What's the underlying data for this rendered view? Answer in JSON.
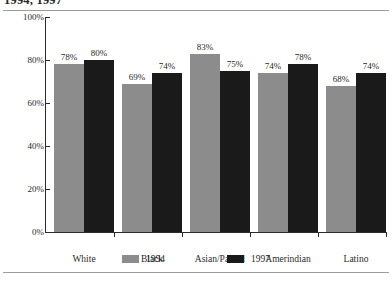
{
  "figure": {
    "title": "1994, 1997"
  },
  "legend": {
    "position": "bottom-center",
    "items": [
      {
        "label": "1994",
        "color": "#8c8c8c"
      },
      {
        "label": "1997",
        "color": "#1a1a1a"
      }
    ]
  },
  "chart_data": {
    "type": "bar",
    "title": "1994, 1997",
    "xlabel": "",
    "ylabel": "",
    "ylim": [
      0,
      100
    ],
    "yticks": [
      "0%",
      "20%",
      "40%",
      "60%",
      "80%",
      "100%"
    ],
    "ytick_values": [
      0,
      20,
      40,
      60,
      80,
      100
    ],
    "grid": false,
    "legend_position": "bottom-center",
    "value_suffix": "%",
    "categories": [
      "White",
      "Black",
      "Asian/Pac.Isl",
      "Amerindian",
      "Latino"
    ],
    "series": [
      {
        "name": "1994",
        "color": "#8c8c8c",
        "values": [
          78,
          69,
          83,
          74,
          68
        ],
        "labels": [
          "78%",
          "69%",
          "83%",
          "74%",
          "68%"
        ]
      },
      {
        "name": "1997",
        "color": "#1a1a1a",
        "values": [
          80,
          74,
          75,
          78,
          74
        ],
        "labels": [
          "80%",
          "74%",
          "75%",
          "78%",
          "74%"
        ]
      }
    ]
  }
}
